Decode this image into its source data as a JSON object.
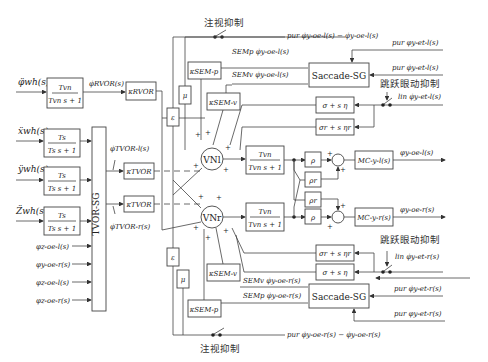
{
  "diagram": {
    "title": "",
    "inputs": {
      "rvor": "φ̈wh(s)",
      "x": "ẍwh(s)",
      "y": "ÿwh(s)",
      "z": "Z̈wh(s)",
      "pos": [
        "φz-oe-l(s)",
        "φy-oe-r(s)",
        "φz-oe-l(s)",
        "φz-oe-r(s)"
      ]
    },
    "blocks": {
      "rvor_tf_num": "Tvn",
      "rvor_tf_den": "Tvn s + 1",
      "otolith_num": "Ts",
      "otolith_den": "Ts s + 1",
      "tvor_sg": "TVOR-SG",
      "k_rvor": "κRVOR",
      "k_tvor": "κTVOR",
      "k_sem_p": "κSEM-p",
      "k_sem_v": "κSEM-v",
      "epsilon": "ε",
      "mu": "μ",
      "vn_l": "VNl",
      "vn_r": "VNr",
      "vn_tf_num": "Tvn",
      "vn_tf_den": "Tvn s + 1",
      "rho": "ρ",
      "rho_r": "ρr",
      "saccade": "Saccade-SG",
      "sigma_eta": "σ + s η",
      "sigma_r_eta": "σr + s ηr",
      "m_l": "MC-y-l(s)",
      "m_r": "MC-y-r(s)"
    },
    "signals": {
      "rvor_out": "φ̇RVOR(s)",
      "tvor_l": "φ̇TVOR-l(s)",
      "tvor_r": "φ̇TVOR-r(s)",
      "sem_p_l": "SEMp φ̇y-oe-l(s)",
      "sem_v_l": "SEMv φ̇y-oe-l(s)",
      "sem_p_r": "SEMp φ̇y-oe-r(s)",
      "sem_v_r": "SEMv φ̇y-oe-r(s)",
      "err_top": "pur φ̇y-oe-l(s) − φ̇y-oe-l(s)",
      "err_bot": "pur φ̇y-oe-r(s) − φ̇y-oe-r(s)",
      "tgt_pos_l": "pur φy-et-l(s)",
      "tgt_vel_l": "pur φ̇y-et-l(s)",
      "lin_l": "lin φ̇y-et-l(s)",
      "lin_r": "lin φ̇y-et-r(s)",
      "tgt_pos_r": "pur φy-et-r(s)",
      "tgt_vel_r": "pur φ̇y-et-r(s)",
      "out_l": "φy-oe-l(s)",
      "out_r": "φy-oe-r(s)"
    },
    "labels": {
      "fixation_top": "注视抑制",
      "fixation_bottom": "注视抑制",
      "saccade_inhibit_top": "跳跃眼动抑制",
      "saccade_inhibit_bottom": "跳跃眼动抑制"
    }
  }
}
